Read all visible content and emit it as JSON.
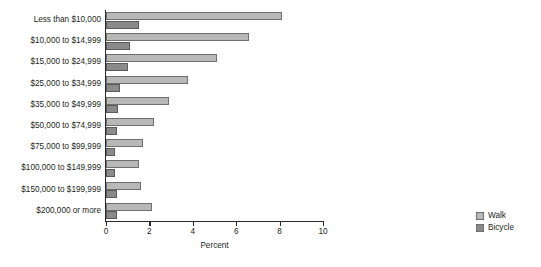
{
  "chart_data": {
    "type": "bar",
    "orientation": "horizontal",
    "title": "",
    "xlabel": "Percent",
    "ylabel": "",
    "xlim": [
      0,
      10
    ],
    "xticks": [
      0,
      2,
      4,
      6,
      8,
      10
    ],
    "xtick_labels": [
      "0",
      "2",
      "4",
      "6",
      "8",
      "10"
    ],
    "grid": false,
    "legend_position": "bottom-right",
    "categories": [
      "Less than $10,000",
      "$10,000 to $14,999",
      "$15,000 to $24,999",
      "$25,000 to $34,999",
      "$35,000 to $49,999",
      "$50,000 to $74,999",
      "$75,000 to $99,999",
      "$100,000 to $149,999",
      "$150,000 to $199,999",
      "$200,000 or more"
    ],
    "series": [
      {
        "name": "Walk",
        "color": "#b8b8b8",
        "values": [
          8.1,
          6.6,
          5.1,
          3.8,
          2.9,
          2.2,
          1.7,
          1.5,
          1.6,
          2.1
        ]
      },
      {
        "name": "Bicycle",
        "color": "#8a8a8a",
        "values": [
          1.5,
          1.1,
          1.0,
          0.65,
          0.55,
          0.5,
          0.4,
          0.4,
          0.5,
          0.5
        ]
      }
    ]
  },
  "legend": {
    "items": [
      {
        "label": "Walk",
        "color": "#b8b8b8"
      },
      {
        "label": "Bicycle",
        "color": "#8a8a8a"
      }
    ]
  }
}
